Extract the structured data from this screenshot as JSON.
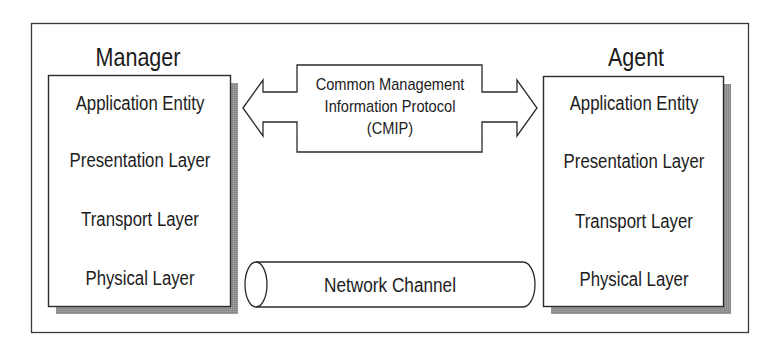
{
  "diagram": {
    "manager": {
      "title": "Manager",
      "layers": [
        "Application Entity",
        "Presentation Layer",
        "Transport Layer",
        "Physical Layer"
      ]
    },
    "agent": {
      "title": "Agent",
      "layers": [
        "Application Entity",
        "Presentation Layer",
        "Transport Layer",
        "Physical Layer"
      ]
    },
    "protocol": {
      "lines": [
        "Common Management",
        "Information Protocol",
        "(CMIP)"
      ],
      "shape": "double-headed-arrow"
    },
    "channel": {
      "label": "Network Channel",
      "shape": "horizontal-cylinder"
    },
    "colors": {
      "stroke": "#2b2b2b",
      "shadow": "#8a8a8a",
      "background": "#ffffff",
      "text": "#1c1c1c"
    }
  }
}
